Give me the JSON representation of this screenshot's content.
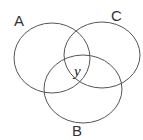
{
  "diagram": {
    "type": "venn",
    "sets": [
      {
        "label": "A",
        "cx": 52,
        "cy": 58,
        "rx": 38,
        "ry": 35
      },
      {
        "label": "C",
        "cx": 102,
        "cy": 55,
        "rx": 38,
        "ry": 33
      },
      {
        "label": "B",
        "cx": 83,
        "cy": 89,
        "rx": 39,
        "ry": 34
      }
    ],
    "region_label": "y",
    "stroke_color": "#555555"
  }
}
